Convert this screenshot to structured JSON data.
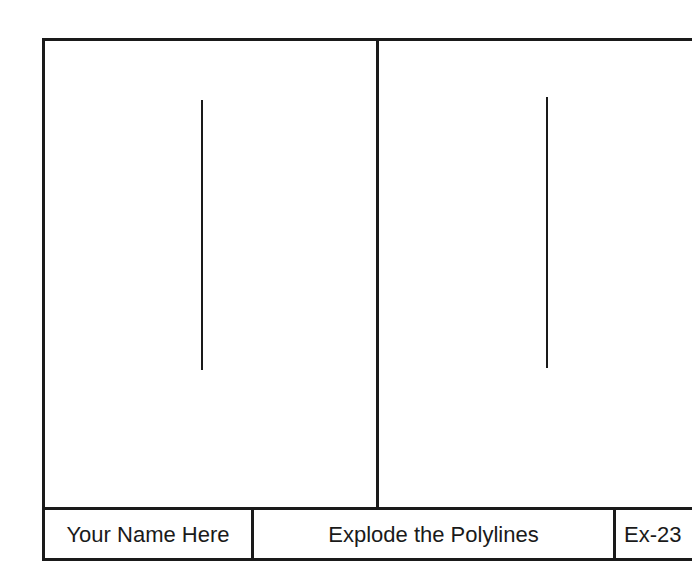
{
  "drawing": {
    "panels": [
      {
        "name": "left-panel",
        "line": {
          "x": 202,
          "y1": 100,
          "y2": 370
        }
      },
      {
        "name": "right-panel",
        "line": {
          "x": 547,
          "y1": 97,
          "y2": 368
        }
      }
    ]
  },
  "title_block": {
    "name": "Your Name Here",
    "title": "Explode the Polylines",
    "exercise": "Ex-23"
  },
  "colors": {
    "line": "#1a1a1a",
    "background": "#ffffff"
  }
}
